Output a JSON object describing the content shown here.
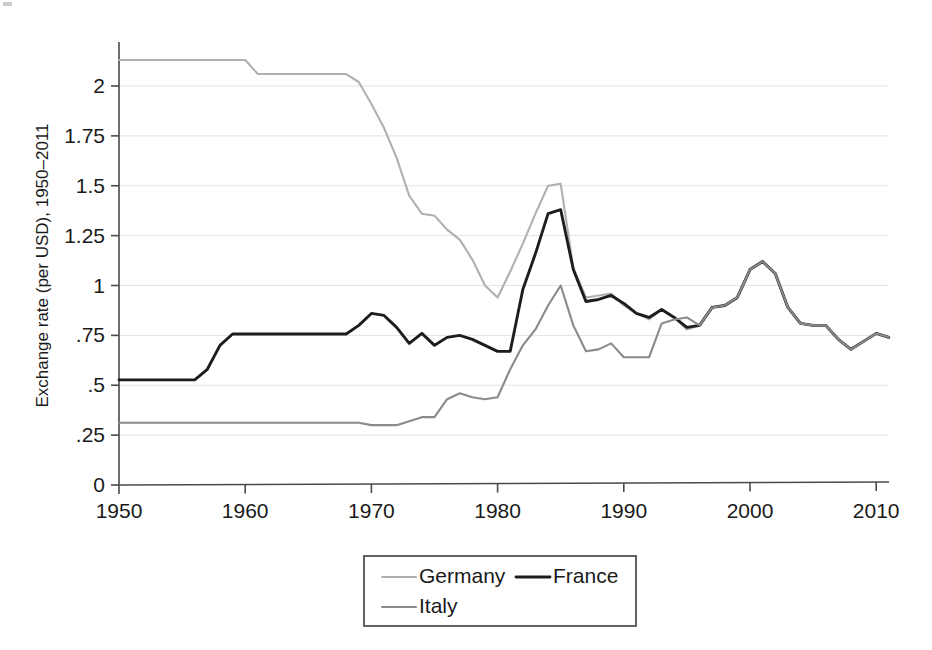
{
  "chart_data": {
    "type": "line",
    "title": "",
    "subtitle": "",
    "xlabel": "",
    "ylabel": "Exchange rate (per USD), 1950–2011",
    "xlim": [
      1950,
      2011
    ],
    "ylim": [
      0,
      2.2
    ],
    "grid": true,
    "grid_axis": "y",
    "legend_position": "bottom-center",
    "x_ticks": [
      1950,
      1960,
      1970,
      1980,
      1990,
      2000,
      2010
    ],
    "x_tick_labels": [
      "1950",
      "1960",
      "1970",
      "1980",
      "1990",
      "2000",
      "2010"
    ],
    "y_ticks": [
      0,
      0.25,
      0.5,
      0.75,
      1,
      1.25,
      1.5,
      1.75,
      2
    ],
    "y_tick_labels": [
      "0",
      ".25",
      ".5",
      ".75",
      "1",
      "1.25",
      "1.5",
      "1.75",
      "2"
    ],
    "x": [
      1950,
      1951,
      1952,
      1953,
      1954,
      1955,
      1956,
      1957,
      1958,
      1959,
      1960,
      1961,
      1962,
      1963,
      1964,
      1965,
      1966,
      1967,
      1968,
      1969,
      1970,
      1971,
      1972,
      1973,
      1974,
      1975,
      1976,
      1977,
      1978,
      1979,
      1980,
      1981,
      1982,
      1983,
      1984,
      1985,
      1986,
      1987,
      1988,
      1989,
      1990,
      1991,
      1992,
      1993,
      1994,
      1995,
      1996,
      1997,
      1998,
      1999,
      2000,
      2001,
      2002,
      2003,
      2004,
      2005,
      2006,
      2007,
      2008,
      2009,
      2010,
      2011
    ],
    "series": [
      {
        "name": "Germany",
        "color": "#b0b0b0",
        "linewidth": 2.1,
        "values": [
          2.13,
          2.13,
          2.13,
          2.13,
          2.13,
          2.13,
          2.13,
          2.13,
          2.13,
          2.13,
          2.13,
          2.06,
          2.06,
          2.06,
          2.06,
          2.06,
          2.06,
          2.06,
          2.06,
          2.02,
          1.91,
          1.79,
          1.64,
          1.45,
          1.36,
          1.35,
          1.28,
          1.23,
          1.13,
          1.0,
          0.94,
          1.07,
          1.21,
          1.36,
          1.5,
          1.51,
          1.09,
          0.94,
          0.95,
          0.96,
          0.9,
          0.86,
          0.83,
          0.88,
          0.84,
          0.78,
          0.8,
          0.89,
          0.9,
          0.94,
          1.08,
          1.12,
          1.06,
          0.89,
          0.81,
          0.8,
          0.8,
          0.73,
          0.68,
          0.72,
          0.76,
          0.74
        ]
      },
      {
        "name": "France",
        "color": "#1d1d1d",
        "linewidth": 2.9,
        "values": [
          0.527,
          0.527,
          0.527,
          0.527,
          0.527,
          0.527,
          0.527,
          0.58,
          0.7,
          0.757,
          0.757,
          0.757,
          0.757,
          0.757,
          0.757,
          0.757,
          0.757,
          0.757,
          0.757,
          0.8,
          0.86,
          0.85,
          0.79,
          0.71,
          0.76,
          0.7,
          0.74,
          0.75,
          0.73,
          0.7,
          0.67,
          0.67,
          0.98,
          1.16,
          1.36,
          1.38,
          1.08,
          0.92,
          0.93,
          0.95,
          0.91,
          0.86,
          0.84,
          0.88,
          0.84,
          0.79,
          0.8,
          0.89,
          0.9,
          0.94,
          1.08,
          1.12,
          1.06,
          0.89,
          0.81,
          0.8,
          0.8,
          0.73,
          0.68,
          0.72,
          0.76,
          0.74
        ]
      },
      {
        "name": "Italy",
        "color": "#8a8a8a",
        "linewidth": 2.1,
        "values": [
          0.312,
          0.312,
          0.312,
          0.312,
          0.312,
          0.312,
          0.312,
          0.312,
          0.312,
          0.312,
          0.312,
          0.312,
          0.312,
          0.312,
          0.312,
          0.312,
          0.312,
          0.312,
          0.312,
          0.312,
          0.3,
          0.3,
          0.3,
          0.32,
          0.34,
          0.34,
          0.43,
          0.46,
          0.44,
          0.43,
          0.44,
          0.58,
          0.7,
          0.78,
          0.9,
          1.0,
          0.8,
          0.67,
          0.68,
          0.71,
          0.64,
          0.64,
          0.64,
          0.81,
          0.83,
          0.84,
          0.8,
          0.89,
          0.9,
          0.94,
          1.08,
          1.12,
          1.06,
          0.89,
          0.81,
          0.8,
          0.8,
          0.73,
          0.68,
          0.72,
          0.76,
          0.74
        ]
      }
    ],
    "legend": [
      {
        "label": "Germany",
        "color": "#b0b0b0"
      },
      {
        "label": "France",
        "color": "#1d1d1d"
      },
      {
        "label": "Italy",
        "color": "#8a8a8a"
      }
    ]
  },
  "geometry": {
    "plot_left": 119,
    "plot_right": 889,
    "plot_bottom": 485,
    "y_zero_px": 485,
    "px_per_unit_y": 199.5,
    "px_per_year_x": 12.62,
    "legend_x": 364,
    "legend_y": 556,
    "legend_w": 272,
    "legend_h": 70
  }
}
